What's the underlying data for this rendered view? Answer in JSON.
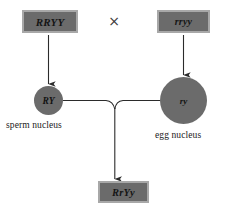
{
  "diagram": {
    "type": "genetics-cross",
    "background_color": "#ffffff",
    "shape_fill_color": "#6b6b6b",
    "shape_border_color": "#a8a8a8",
    "line_color": "#2b2b2b",
    "text_color": "#151515"
  },
  "parents": {
    "left": {
      "genotype": "RRYY",
      "shape": "rectangle"
    },
    "right": {
      "genotype": "rryy",
      "shape": "rectangle"
    },
    "cross_symbol": "×"
  },
  "gametes": {
    "sperm": {
      "genotype": "RY",
      "label": "sperm nucleus",
      "shape": "circle"
    },
    "egg": {
      "genotype": "ry",
      "label": "egg nucleus",
      "shape": "circle"
    }
  },
  "offspring": {
    "genotype": "RrYy",
    "shape": "rectangle"
  }
}
